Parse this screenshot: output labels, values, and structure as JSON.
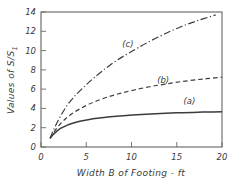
{
  "chart_data": {
    "type": "line",
    "title": "",
    "xlabel": "Width B of Footing - ft",
    "ylabel": "Values of S/S",
    "ylabel_subscript": "1",
    "xlim": [
      0,
      20
    ],
    "ylim": [
      0,
      14
    ],
    "grid": false,
    "legend_position": "inline-curve-labels",
    "xticks": [
      "0",
      "5",
      "10",
      "15",
      "20"
    ],
    "xtick_values": [
      0,
      5,
      10,
      15,
      20
    ],
    "yticks": [
      "0",
      "2",
      "4",
      "6",
      "8",
      "10",
      "12",
      "14"
    ],
    "ytick_values": [
      0,
      2,
      4,
      6,
      8,
      10,
      12,
      14
    ],
    "series": [
      {
        "name": "(a)",
        "style": "solid",
        "label_x": 16.4,
        "label_y": 4.45,
        "x": [
          1.0,
          1.3,
          1.7,
          2.2,
          2.8,
          3.5,
          4.3,
          5.2,
          6.2,
          7.4,
          8.7,
          10.1,
          11.6,
          13.2,
          15.0,
          16.8,
          18.4,
          20.0
        ],
        "values": [
          0.9,
          1.25,
          1.6,
          1.95,
          2.22,
          2.46,
          2.66,
          2.83,
          2.98,
          3.11,
          3.22,
          3.32,
          3.4,
          3.47,
          3.54,
          3.59,
          3.63,
          3.66
        ]
      },
      {
        "name": "(b)",
        "style": "dashed",
        "label_x": 13.5,
        "label_y": 6.6,
        "x": [
          1.0,
          1.4,
          1.9,
          2.5,
          3.2,
          4.1,
          5.1,
          6.2,
          7.5,
          8.9,
          10.4,
          12.0,
          13.7,
          15.5,
          17.4,
          18.7,
          20.0
        ],
        "values": [
          0.9,
          1.5,
          2.15,
          2.75,
          3.3,
          3.85,
          4.35,
          4.8,
          5.22,
          5.6,
          5.94,
          6.25,
          6.52,
          6.78,
          7.0,
          7.12,
          7.25
        ]
      },
      {
        "name": "(c)",
        "style": "dash-dot",
        "label_x": 9.6,
        "label_y": 10.35,
        "x": [
          1.0,
          1.5,
          2.1,
          2.8,
          3.6,
          4.6,
          5.7,
          7.0,
          8.4,
          10.0,
          11.7,
          13.5,
          15.4,
          17.3,
          19.3
        ],
        "values": [
          0.9,
          2.0,
          3.1,
          4.2,
          5.15,
          6.1,
          7.05,
          8.05,
          9.0,
          9.9,
          10.8,
          11.65,
          12.45,
          13.1,
          13.7
        ]
      }
    ]
  }
}
